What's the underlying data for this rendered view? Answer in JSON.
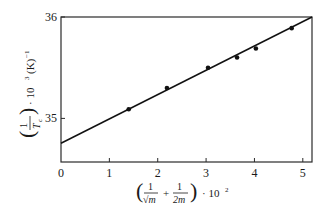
{
  "chart_data": {
    "type": "scatter",
    "title": "",
    "xlabel": "(1/√m + 1/2m) · 10²",
    "ylabel": "(1/T_c) · 10³ (K)⁻¹",
    "xlim": [
      0,
      5.19
    ],
    "ylim": [
      34.57,
      36
    ],
    "x_ticks": [
      0,
      1,
      2,
      3,
      4,
      5
    ],
    "x_tick_labels": [
      "0",
      "1",
      "2",
      "3",
      "4",
      "5"
    ],
    "y_ticks": [
      35,
      36
    ],
    "y_tick_labels": [
      "35",
      "36"
    ],
    "grid": false,
    "legend": null,
    "series": [
      {
        "name": "measured",
        "type": "scatter",
        "x": [
          1.4,
          2.19,
          3.04,
          3.64,
          4.03,
          4.77
        ],
        "y": [
          35.09,
          35.3,
          35.5,
          35.6,
          35.69,
          35.89
        ]
      },
      {
        "name": "linear fit",
        "type": "line",
        "x": [
          0,
          5.19
        ],
        "y": [
          34.755,
          36.0
        ]
      }
    ]
  },
  "axis_labels": {
    "x_paren_open": "(",
    "x_frac1_num": "1",
    "x_frac1_den": "√m",
    "x_plus": "+",
    "x_frac2_num": "1",
    "x_frac2_den": "2m",
    "x_paren_close": ")",
    "x_suffix": "· 10",
    "x_exp": "2",
    "y_frac_num": "1",
    "y_frac_den": "T",
    "y_frac_den_sub": "c",
    "y_suffix": "· 10",
    "y_exp": "3",
    "y_unit": "(K)",
    "y_unit_exp": "−1"
  }
}
